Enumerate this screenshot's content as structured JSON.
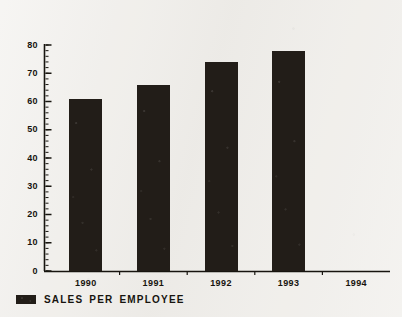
{
  "chart_data": {
    "type": "bar",
    "title": "",
    "xlabel": "",
    "ylabel": "",
    "categories": [
      "1990",
      "1991",
      "1992",
      "1993",
      "1994"
    ],
    "values": [
      61,
      66,
      74,
      78,
      null
    ],
    "series": [
      {
        "name": "SALES PER EMPLOYEE",
        "values": [
          61,
          66,
          74,
          78,
          null
        ],
        "color": "#221d18"
      }
    ],
    "ylim": [
      0,
      80
    ],
    "ytick_labels": [
      "0",
      "10",
      "20",
      "30",
      "40",
      "50",
      "60",
      "70",
      "80"
    ],
    "ytick_values": [
      0,
      10,
      20,
      30,
      40,
      50,
      60,
      70,
      80
    ],
    "minor_tick_step": 2,
    "grid": false,
    "legend_position": "bottom-left"
  },
  "legend": {
    "entries": [
      {
        "label": "SALES PER EMPLOYEE",
        "color": "#221d18"
      }
    ]
  },
  "colors": {
    "background": "#f1efeb",
    "ink": "#17140f",
    "bar": "#221d18"
  }
}
